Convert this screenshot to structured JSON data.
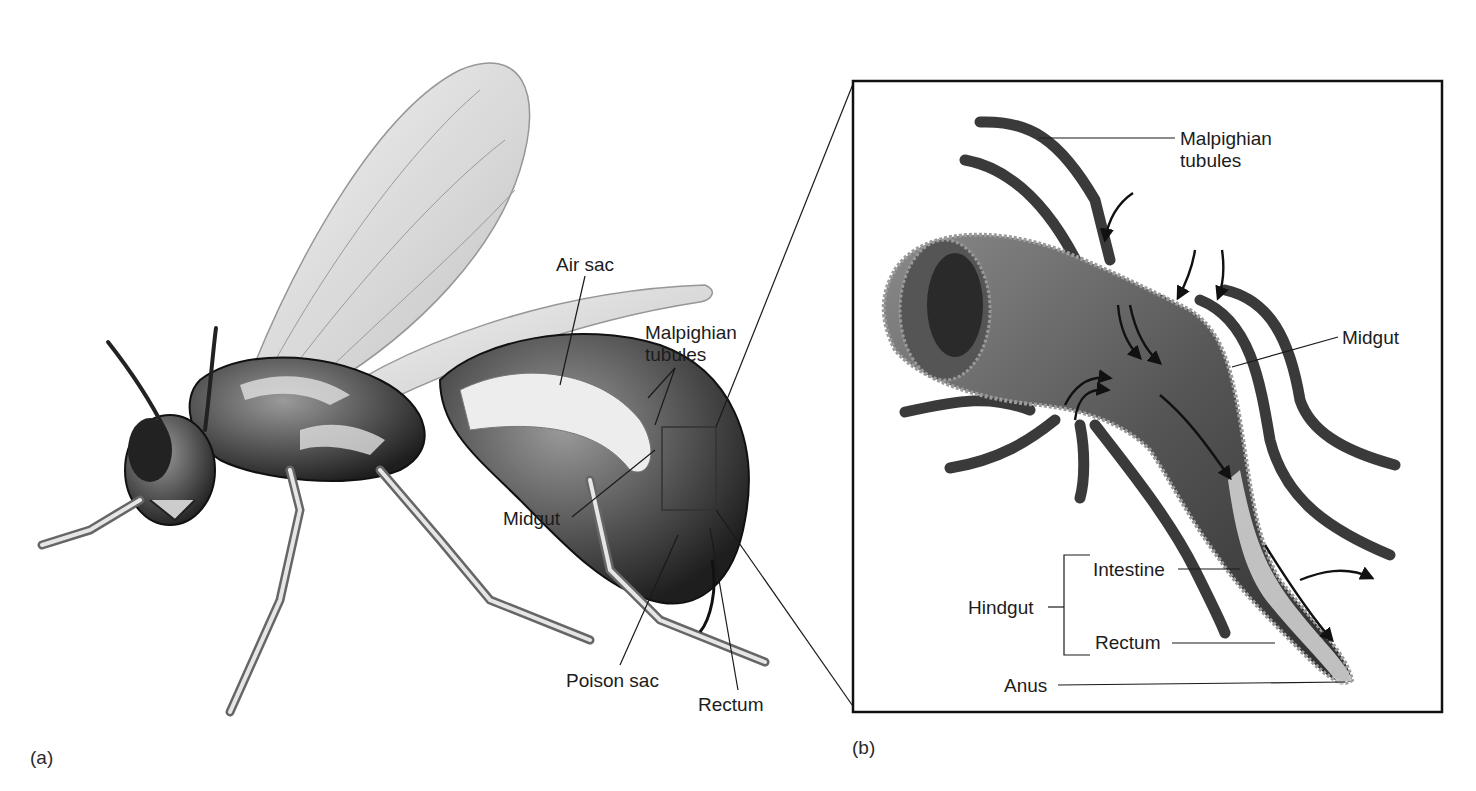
{
  "figure": {
    "panels": [
      {
        "id": "a",
        "tag": "(a)",
        "subject": "wasp-like insect, cutaway abdomen",
        "labels": {
          "air_sac": "Air sac",
          "malpighian_tubules": "Malpighian\ntubules",
          "midgut": "Midgut",
          "poison_sac": "Poison sac",
          "rectum": "Rectum"
        }
      },
      {
        "id": "b",
        "tag": "(b)",
        "subject": "enlarged digestive tract with Malpighian tubules",
        "labels": {
          "malpighian_tubules": "Malpighian\ntubules",
          "midgut": "Midgut",
          "hindgut": "Hindgut",
          "intestine": "Intestine",
          "rectum": "Rectum",
          "anus": "Anus"
        }
      }
    ],
    "colors": {
      "line": "#1a1a1a",
      "dark_tissue": "#2b2b2b",
      "mid_tissue": "#6e6e6e",
      "light_tissue": "#d9d9d9",
      "background": "#ffffff"
    }
  }
}
